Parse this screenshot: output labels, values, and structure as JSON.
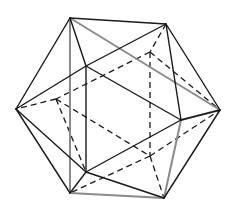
{
  "diagram": {
    "vertices": {
      "A": [
        70,
        18
      ],
      "B": [
        166,
        24
      ],
      "L": [
        16,
        109
      ],
      "R": [
        220,
        110
      ],
      "F1": [
        86,
        66
      ],
      "F2": [
        181,
        120
      ],
      "F3": [
        86,
        172
      ],
      "BL": [
        70,
        193
      ],
      "BR": [
        164,
        198
      ],
      "K1": [
        150,
        52
      ],
      "K2": [
        56,
        99
      ],
      "K3": [
        150,
        156
      ]
    },
    "solid_edges": [
      [
        "A",
        "B"
      ],
      [
        "A",
        "L"
      ],
      [
        "A",
        "F1"
      ],
      [
        "B",
        "F1"
      ],
      [
        "B",
        "R"
      ],
      [
        "B",
        "F2"
      ],
      [
        "L",
        "F1"
      ],
      [
        "L",
        "BL"
      ],
      [
        "L",
        "F3"
      ],
      [
        "F1",
        "F2"
      ],
      [
        "F1",
        "F3"
      ],
      [
        "F2",
        "R"
      ],
      [
        "F3",
        "F2"
      ],
      [
        "R",
        "BR"
      ],
      [
        "F3",
        "BL"
      ],
      [
        "F3",
        "BR"
      ]
    ],
    "gray_edges": [
      [
        "A",
        "R"
      ],
      [
        "A",
        "BL"
      ],
      [
        "F2",
        "BR"
      ],
      [
        "BL",
        "BR"
      ],
      [
        "F2",
        "R"
      ]
    ],
    "dashed_edges": [
      [
        "B",
        "K1"
      ],
      [
        "K1",
        "K2"
      ],
      [
        "K1",
        "K3"
      ],
      [
        "K1",
        "R"
      ],
      [
        "K2",
        "L"
      ],
      [
        "K2",
        "K3"
      ],
      [
        "K3",
        "R"
      ],
      [
        "K3",
        "BL"
      ],
      [
        "K3",
        "BR"
      ],
      [
        "K2",
        "F3"
      ]
    ],
    "colors": {
      "line": "#1a1a1a",
      "gray_line": "#8a8a8a",
      "background": "#ffffff"
    }
  }
}
